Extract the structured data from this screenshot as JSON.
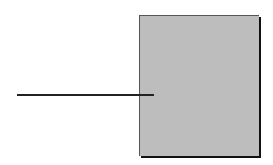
{
  "diagram": {
    "shapes": [
      {
        "type": "rectangle",
        "fill": "#bdbdbd",
        "shadow": "#111111"
      },
      {
        "type": "line",
        "color": "#222222"
      }
    ],
    "text": []
  }
}
